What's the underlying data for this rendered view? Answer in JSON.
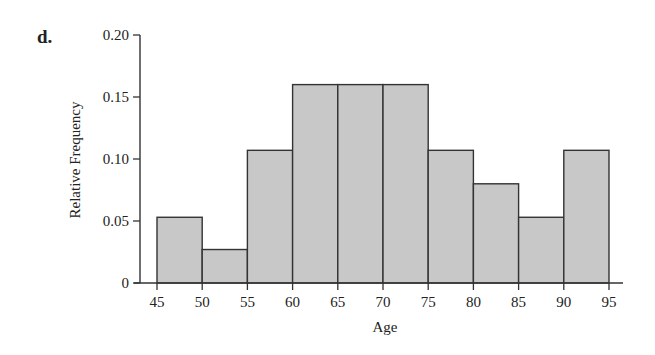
{
  "panel_label": "d.",
  "chart_data": {
    "type": "bar",
    "subtype": "histogram",
    "title": "",
    "xlabel": "Age",
    "ylabel": "Relative Frequency",
    "bins": [
      [
        45,
        50
      ],
      [
        50,
        55
      ],
      [
        55,
        60
      ],
      [
        60,
        65
      ],
      [
        65,
        70
      ],
      [
        70,
        75
      ],
      [
        75,
        80
      ],
      [
        80,
        85
      ],
      [
        85,
        90
      ],
      [
        90,
        95
      ]
    ],
    "categories": [
      "45-50",
      "50-55",
      "55-60",
      "60-65",
      "65-70",
      "70-75",
      "75-80",
      "80-85",
      "85-90",
      "90-95"
    ],
    "values": [
      0.053,
      0.027,
      0.107,
      0.16,
      0.16,
      0.16,
      0.107,
      0.08,
      0.053,
      0.107
    ],
    "x_ticks": [
      "45",
      "50",
      "55",
      "60",
      "65",
      "70",
      "75",
      "80",
      "85",
      "90",
      "95"
    ],
    "y_ticks": [
      "0",
      "0.05",
      "0.10",
      "0.15",
      "0.20"
    ],
    "ylim": [
      0,
      0.2
    ],
    "xlim": [
      45,
      95
    ],
    "grid": false,
    "legend": null,
    "bar_color": "#c8c8c8",
    "edge_color": "#333333"
  }
}
